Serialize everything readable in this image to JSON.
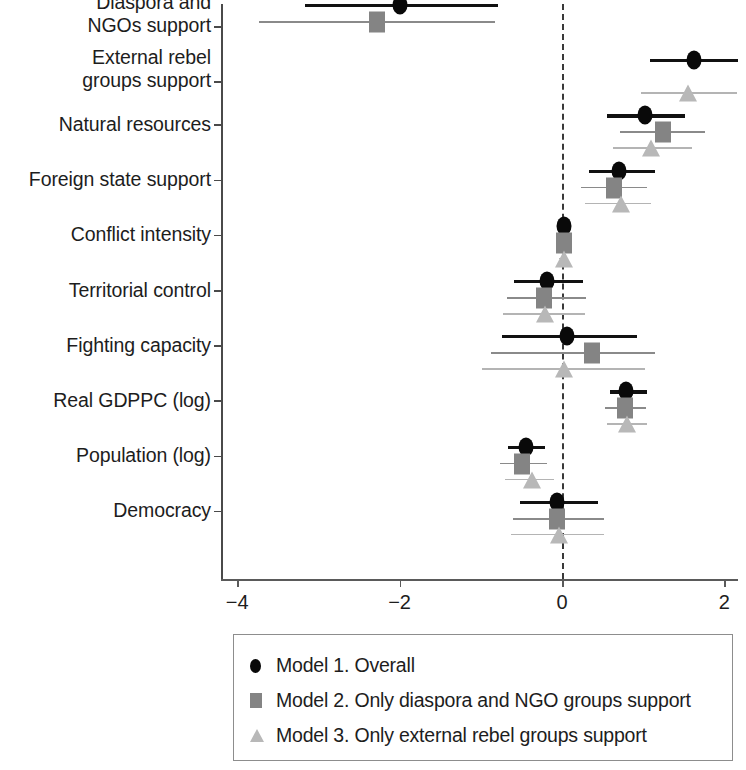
{
  "chart_data": {
    "type": "scatter",
    "subtype": "coefficient-plot-with-error-bars",
    "title": "",
    "xlabel": "",
    "ylabel": "",
    "xlim": [
      -4.35,
      2.35
    ],
    "xticks": [
      -4,
      -2,
      0,
      2
    ],
    "xtick_labels": [
      "−4",
      "−2",
      "0",
      "2"
    ],
    "grid": false,
    "reference_line": 0,
    "legend_position": "bottom",
    "categories": [
      "Diaspora and\nNGOs support",
      "External rebel\ngroups support",
      "Natural resources",
      "Foreign state support",
      "Conflict intensity",
      "Territorial control",
      "Fighting capacity",
      "Real GDPPC (log)",
      "Population (log)",
      "Democracy"
    ],
    "series": [
      {
        "name": "Model 1. Overall",
        "marker": "circle",
        "color": "#090909",
        "values": [
          -2.0,
          1.63,
          1.02,
          0.7,
          0.02,
          -0.18,
          0.06,
          0.79,
          -0.44,
          -0.06
        ],
        "ci_low": [
          -3.17,
          1.08,
          0.55,
          0.33,
          -0.03,
          -0.59,
          -0.74,
          0.59,
          -0.66,
          -0.52
        ],
        "ci_high": [
          -0.79,
          2.17,
          1.51,
          1.15,
          0.07,
          0.26,
          0.92,
          1.05,
          -0.21,
          0.44
        ]
      },
      {
        "name": "Model 2. Only diaspora and NGO groups support",
        "marker": "square",
        "color": "#848484",
        "values": [
          -2.28,
          null,
          1.24,
          0.64,
          0.02,
          -0.22,
          0.37,
          0.78,
          -0.49,
          -0.06
        ],
        "ci_low": [
          -3.73,
          null,
          0.72,
          0.23,
          -0.04,
          -0.68,
          -0.88,
          0.53,
          -0.76,
          -0.6
        ],
        "ci_high": [
          -0.82,
          null,
          1.76,
          1.05,
          0.08,
          0.3,
          1.15,
          1.03,
          -0.18,
          0.52
        ]
      },
      {
        "name": "Model 3. Only external rebel groups support",
        "marker": "triangle",
        "color": "#b8b8b8",
        "values": [
          null,
          1.55,
          1.1,
          0.73,
          0.02,
          -0.21,
          0.02,
          0.8,
          -0.37,
          -0.04
        ],
        "ci_low": [
          null,
          0.97,
          0.63,
          0.28,
          -0.04,
          -0.73,
          -0.98,
          0.55,
          -0.7,
          -0.63
        ],
        "ci_high": [
          null,
          2.15,
          1.6,
          1.1,
          0.08,
          0.28,
          1.02,
          1.05,
          -0.1,
          0.52
        ]
      }
    ]
  },
  "axis": {
    "tick_labels": [
      "−4",
      "−2",
      "0",
      "2"
    ]
  },
  "y_labels": [
    "Diaspora and\nNGOs support",
    "External rebel\ngroups support",
    "Natural resources",
    "Foreign state support",
    "Conflict intensity",
    "Territorial control",
    "Fighting capacity",
    "Real GDPPC (log)",
    "Population (log)",
    "Democracy"
  ],
  "legend": {
    "items": [
      {
        "key": "circle-marker",
        "label": "Model 1. Overall"
      },
      {
        "key": "square-marker",
        "label": "Model 2. Only diaspora and NGO groups support"
      },
      {
        "key": "triangle-marker",
        "label": "Model 3. Only external rebel groups support"
      }
    ]
  },
  "colors": {
    "model1": "#090909",
    "model2": "#848484",
    "model3": "#b8b8b8",
    "axis": "#5a5a5a",
    "reference_line": "#3a3a3a"
  }
}
